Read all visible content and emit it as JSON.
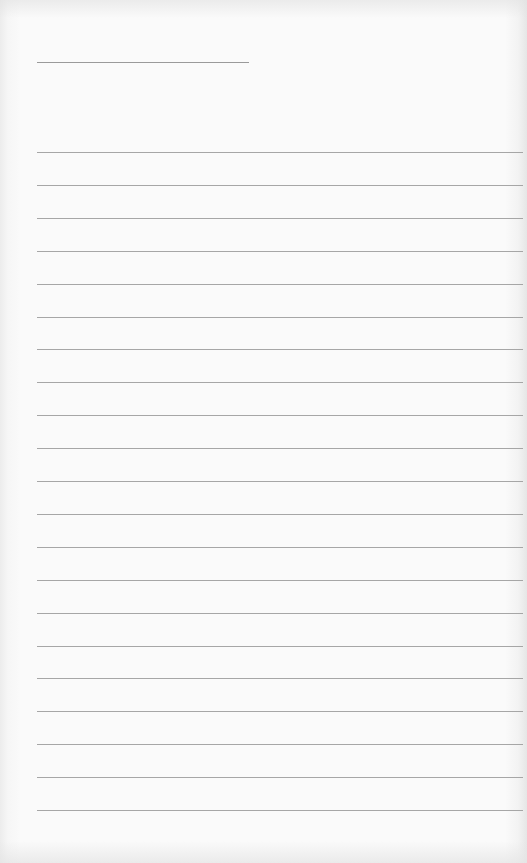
{
  "document": {
    "type": "blank lined page",
    "heading_line": {
      "label": "",
      "x": 37,
      "y": 62,
      "width": 212
    },
    "lines": {
      "count": 21,
      "start_y": 152,
      "spacing": 32.9,
      "x": 37,
      "width": 486,
      "values": [
        "",
        "",
        "",
        "",
        "",
        "",
        "",
        "",
        "",
        "",
        "",
        "",
        "",
        "",
        "",
        "",
        "",
        "",
        "",
        "",
        ""
      ]
    },
    "colors": {
      "paper": "#fafafa",
      "line": "#a6a6a6",
      "heading_line": "#9a9a9a"
    }
  }
}
